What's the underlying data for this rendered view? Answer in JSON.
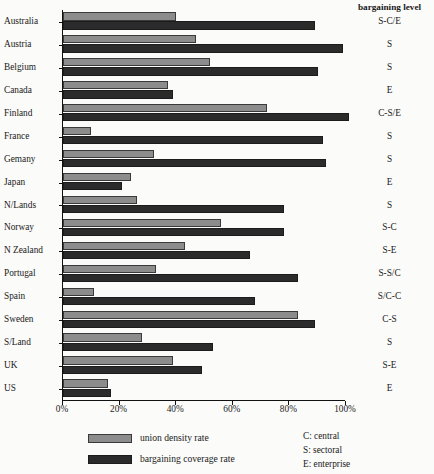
{
  "chart_data": {
    "type": "bar",
    "orientation": "horizontal",
    "title": "",
    "xlabel": "",
    "ylabel": "",
    "xlim": [
      0,
      100
    ],
    "xticks": [
      0,
      20,
      40,
      60,
      80,
      100
    ],
    "xtick_labels": [
      "0%",
      "20%",
      "40%",
      "60%",
      "80%",
      "100%"
    ],
    "grid": false,
    "legend_position": "bottom-left",
    "categories": [
      "Australia",
      "Austria",
      "Belgium",
      "Canada",
      "Finland",
      "France",
      "Gemany",
      "Japan",
      "N/Lands",
      "Norway",
      "N Zealand",
      "Portugal",
      "Spain",
      "Sweden",
      "S/Land",
      "UK",
      "US"
    ],
    "series": [
      {
        "name": "union density rate",
        "color": "#8c8c8c",
        "values": [
          40,
          47,
          52,
          37,
          72,
          10,
          32,
          24,
          26,
          56,
          43,
          33,
          11,
          83,
          28,
          39,
          16
        ]
      },
      {
        "name": "bargaining coverage rate",
        "color": "#2b2b2b",
        "values": [
          89,
          99,
          90,
          39,
          101,
          92,
          93,
          21,
          78,
          78,
          66,
          83,
          68,
          89,
          53,
          49,
          17
        ]
      }
    ],
    "annotation_column": {
      "header": "bargaining level",
      "values": [
        "S-C/E",
        "S",
        "S",
        "E",
        "C-S/E",
        "S",
        "S",
        "E",
        "S",
        "S-C",
        "S-E",
        "S-S/C",
        "S/C-C",
        "C-S",
        "S",
        "S-E",
        "E"
      ]
    },
    "key": [
      "C: central",
      "S: sectoral",
      "E: enterprise"
    ]
  }
}
